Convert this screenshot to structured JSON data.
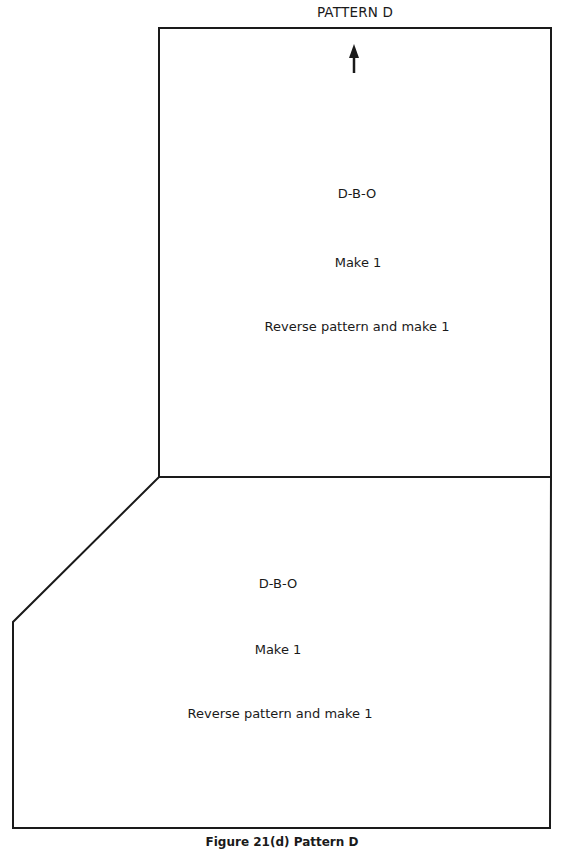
{
  "title": "PATTERN D",
  "grain_arrow": {
    "icon": "up-arrow-icon",
    "direction": "up"
  },
  "pieces": [
    {
      "name": "upper-piece",
      "shape": "rectangle",
      "labels": {
        "code": "D-B-O",
        "instruction": "Make 1",
        "reverse_instruction": "Reverse pattern and make 1"
      }
    },
    {
      "name": "lower-piece",
      "shape": "pentagon-with-angled-corner",
      "labels": {
        "code": "D-B-O",
        "instruction": "Make 1",
        "reverse_instruction": "Reverse pattern and make 1"
      }
    }
  ],
  "caption": "Figure 21(d) Pattern D",
  "colors": {
    "line": "#1a1a1a",
    "background": "#ffffff",
    "text": "#1a1a1a"
  }
}
